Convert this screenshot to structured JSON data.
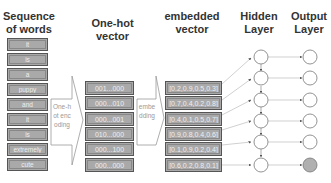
{
  "headers": {
    "words": "Sequence of words",
    "onehot": "One-hot vector",
    "embedded": "embedded vector",
    "hidden": "Hidden Layer",
    "output": "Output Layer"
  },
  "words": [
    "it",
    "is",
    "a",
    "puppy",
    "and",
    "it",
    "is",
    "extremely",
    "cute"
  ],
  "onehot_vectors": [
    "001...000",
    "000...010",
    "000...001",
    "010...000",
    "000...100",
    "000...000"
  ],
  "embedded_vectors": [
    "[0.2,0.9,0.5,0.3]",
    "[0.7,0.4,0.2,0.8]",
    "[0.4,0.1,0.5,0.7]",
    "[0.9,0.8,0.4,0.6]",
    "[0.1,0.9,0.2,0.4]",
    "[0.6,0.2,0.8,0.1]"
  ],
  "arrows": {
    "encoding_label": "One-hot encoding",
    "embedding_label": "embedding"
  },
  "nodes": {
    "hidden_count": 6,
    "output_count": 6,
    "highlighted_output_index": 5,
    "highlight_color": "#b0b0b0"
  }
}
